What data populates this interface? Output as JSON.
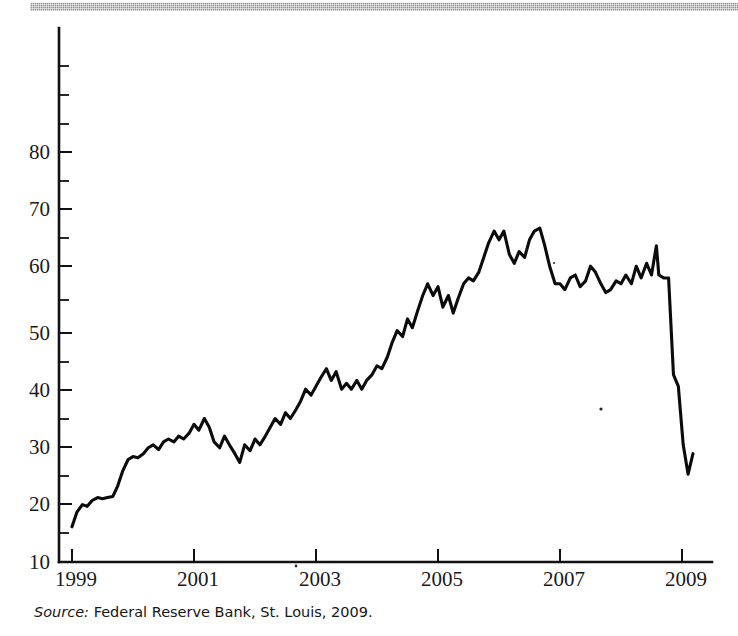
{
  "figure": {
    "source_note": {
      "label": "Source:",
      "text": "Federal Reserve Bank, St. Louis, 2009."
    }
  },
  "chart_data": {
    "type": "line",
    "title": "",
    "subtitle": "",
    "xlabel": "",
    "ylabel": "",
    "xlim": [
      1999.0,
      2009.5
    ],
    "ylim": [
      10,
      85
    ],
    "grid": false,
    "legend": null,
    "axis": {
      "y_major_ticks": [
        10,
        20,
        30,
        40,
        50,
        60,
        70,
        80
      ],
      "y_major_tick_labels": [
        "10",
        "20",
        "30",
        "40",
        "50",
        "60",
        "70",
        "80"
      ],
      "y_minor_ticks": [
        15,
        25,
        35,
        45,
        55,
        65,
        75
      ],
      "x_major_ticks": [
        1999,
        2001,
        2003,
        2005,
        2007,
        2009
      ],
      "x_major_tick_labels": [
        "1999",
        "2001",
        "2003",
        "2005",
        "2007",
        "2009"
      ],
      "y_axis_top_value": 85,
      "y_axis_bottom_value": 10
    },
    "series": [
      {
        "name": "series-1",
        "color": "#0b0b0b",
        "x": [
          1999.0,
          1999.08,
          1999.17,
          1999.25,
          1999.33,
          1999.42,
          1999.5,
          1999.58,
          1999.67,
          1999.75,
          1999.83,
          1999.92,
          2000.0,
          2000.08,
          2000.17,
          2000.25,
          2000.33,
          2000.42,
          2000.5,
          2000.58,
          2000.67,
          2000.75,
          2000.83,
          2000.92,
          2001.0,
          2001.08,
          2001.17,
          2001.25,
          2001.33,
          2001.42,
          2001.5,
          2001.58,
          2001.67,
          2001.75,
          2001.83,
          2001.92,
          2002.0,
          2002.08,
          2002.17,
          2002.25,
          2002.33,
          2002.42,
          2002.5,
          2002.58,
          2002.67,
          2002.75,
          2002.83,
          2002.92,
          2003.0,
          2003.08,
          2003.17,
          2003.25,
          2003.33,
          2003.42,
          2003.5,
          2003.58,
          2003.67,
          2003.75,
          2003.83,
          2003.92,
          2004.0,
          2004.08,
          2004.17,
          2004.25,
          2004.33,
          2004.42,
          2004.5,
          2004.58,
          2004.67,
          2004.75,
          2004.83,
          2004.92,
          2005.0,
          2005.08,
          2005.17,
          2005.25,
          2005.33,
          2005.42,
          2005.5,
          2005.58,
          2005.67,
          2005.75,
          2005.83,
          2005.92,
          2006.0,
          2006.08,
          2006.17,
          2006.25,
          2006.33,
          2006.42,
          2006.5,
          2006.58,
          2006.67,
          2006.75,
          2006.83,
          2006.92,
          2007.0,
          2007.08,
          2007.17,
          2007.25,
          2007.33,
          2007.42,
          2007.5,
          2007.58,
          2007.67,
          2007.75,
          2007.83,
          2007.92,
          2008.0,
          2008.08,
          2008.17,
          2008.25,
          2008.33,
          2008.42,
          2008.5,
          2008.58,
          2008.62,
          2008.7,
          2008.78,
          2008.86,
          2008.94,
          2009.02,
          2009.1,
          2009.18
        ],
        "y": [
          16.0,
          18.5,
          19.8,
          19.5,
          20.5,
          21.0,
          20.8,
          21.0,
          21.2,
          23.0,
          25.5,
          27.5,
          28.0,
          27.8,
          28.5,
          29.5,
          30.0,
          29.2,
          30.5,
          31.0,
          30.5,
          31.5,
          31.0,
          32.0,
          33.5,
          32.5,
          34.5,
          33.0,
          30.5,
          29.5,
          31.5,
          30.0,
          28.5,
          27.0,
          30.0,
          29.0,
          31.0,
          30.0,
          31.5,
          33.0,
          34.5,
          33.5,
          35.5,
          34.5,
          36.0,
          37.5,
          39.5,
          38.5,
          40.0,
          41.5,
          43.0,
          41.0,
          42.5,
          39.5,
          40.5,
          39.5,
          41.0,
          39.5,
          41.0,
          42.0,
          43.5,
          43.0,
          45.0,
          47.5,
          49.5,
          48.5,
          51.5,
          50.0,
          53.0,
          55.5,
          57.5,
          55.5,
          57.0,
          53.5,
          55.5,
          52.5,
          55.0,
          57.5,
          58.5,
          58.0,
          59.5,
          62.0,
          64.5,
          66.5,
          65.0,
          66.5,
          62.5,
          61.0,
          63.0,
          62.0,
          65.0,
          66.5,
          67.0,
          64.0,
          60.5,
          57.5,
          57.5,
          56.5,
          58.5,
          59.0,
          57.0,
          58.0,
          60.5,
          59.5,
          57.5,
          56.0,
          56.5,
          58.0,
          57.5,
          59.0,
          57.5,
          60.5,
          58.5,
          61.0,
          59.0,
          64.0,
          59.0,
          58.5,
          58.5,
          42.0,
          40.0,
          30.0,
          25.0,
          28.5
        ],
        "start_value": 16.0,
        "peak_value": 67.0,
        "peak_x": 2006.67,
        "end_value": 26.0,
        "crash_start_x": 2008.62,
        "crash_start_value": 58.5,
        "crash_end_x": 2009.1,
        "crash_end_value": 25.0
      }
    ],
    "annotations": []
  }
}
